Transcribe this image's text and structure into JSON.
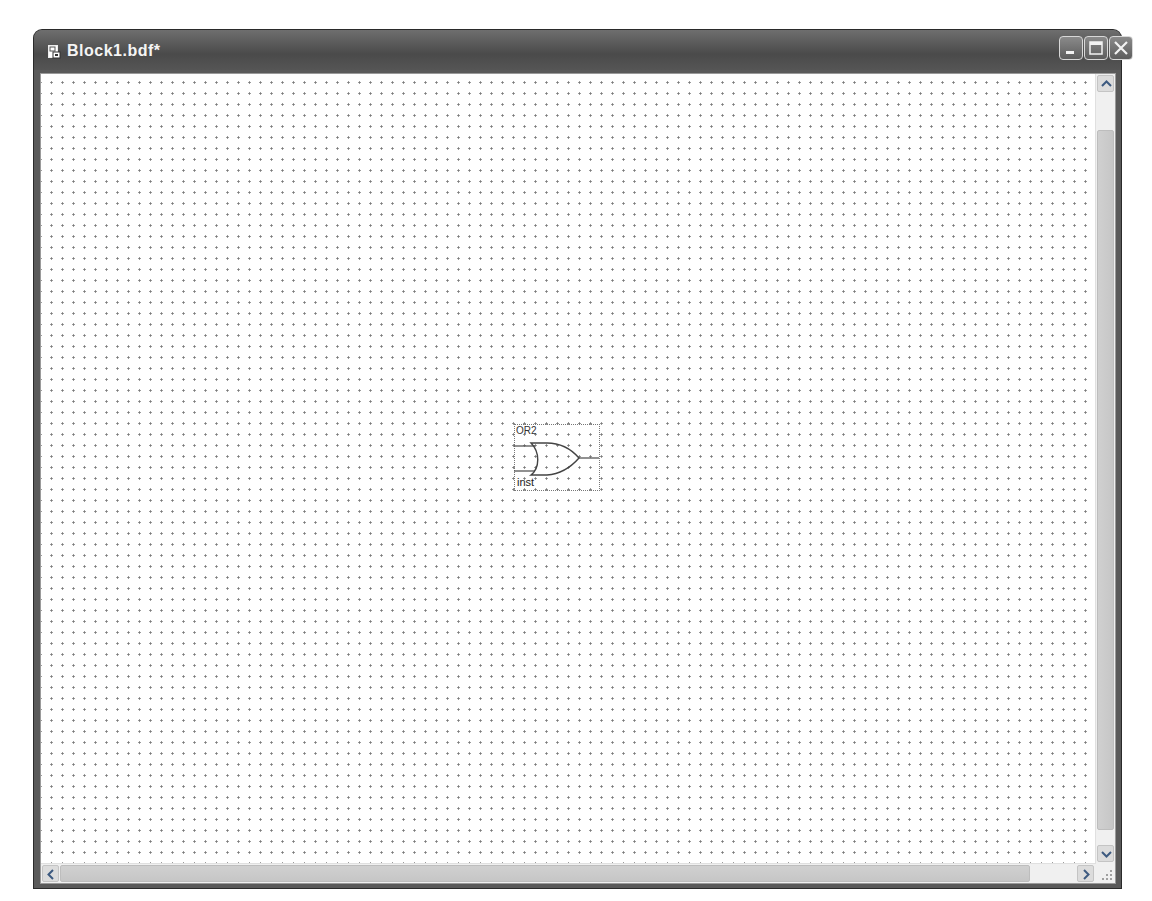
{
  "window": {
    "title": "Block1.bdf*",
    "icon": "block-diagram-file-icon",
    "controls": {
      "minimize": "minimize-icon",
      "maximize": "maximize-icon",
      "close": "close-icon"
    }
  },
  "canvas": {
    "grid": "dotted",
    "symbols": [
      {
        "type": "OR2",
        "name_label": "OR2",
        "instance_label": "inst",
        "inputs": 2,
        "outputs": 1
      }
    ]
  },
  "scrollbars": {
    "vertical": {
      "up_icon": "chevron-up-icon",
      "down_icon": "chevron-down-icon"
    },
    "horizontal": {
      "left_icon": "chevron-left-icon",
      "right_icon": "chevron-right-icon"
    }
  },
  "colors": {
    "titlebar": "#555555",
    "title_text": "#f4f4f4",
    "canvas_bg": "#ffffff",
    "grid_dot": "#7a7a7a",
    "scrollbar_track": "#f0f0f0",
    "scrollbar_thumb": "#c8c8c8"
  }
}
